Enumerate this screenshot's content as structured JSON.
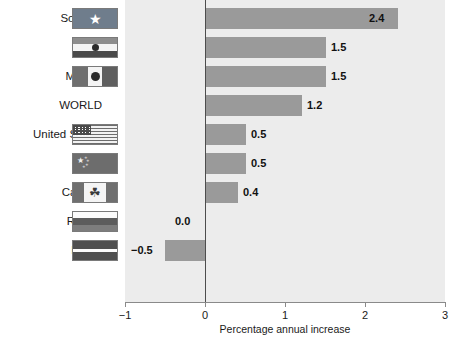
{
  "chart_data": {
    "type": "bar",
    "orientation": "horizontal",
    "title": "",
    "xlabel": "Percentage annual increase",
    "ylabel": "",
    "xlim": [
      -1,
      3
    ],
    "xticks": [
      "−1",
      "0",
      "1",
      "2",
      "3"
    ],
    "xtick_values": [
      -1,
      0,
      1,
      2,
      3
    ],
    "grid": false,
    "legend": "none",
    "categories": [
      "Somalia",
      "India",
      "Mexico",
      "WORLD",
      "United States",
      "China",
      "Canada",
      "Russia",
      "Latvia"
    ],
    "values": [
      2.4,
      1.5,
      1.5,
      1.2,
      0.5,
      0.5,
      0.4,
      0.0,
      -0.5
    ],
    "value_labels": [
      "2.4",
      "1.5",
      "1.5",
      "1.2",
      "0.5",
      "0.5",
      "0.4",
      "0.0",
      "−0.5"
    ],
    "bars": [
      {
        "label": "Somalia",
        "value": 2.4,
        "value_label": "2.4",
        "flag": "somalia-flag",
        "label_inside_bar": true
      },
      {
        "label": "India",
        "value": 1.5,
        "value_label": "1.5",
        "flag": "india-flag",
        "label_inside_bar": false
      },
      {
        "label": "Mexico",
        "value": 1.5,
        "value_label": "1.5",
        "flag": "mexico-flag",
        "label_inside_bar": false
      },
      {
        "label": "WORLD",
        "value": 1.2,
        "value_label": "1.2",
        "flag": "none",
        "label_inside_bar": false
      },
      {
        "label": "United States",
        "value": 0.5,
        "value_label": "0.5",
        "flag": "united-states-flag",
        "label_inside_bar": false
      },
      {
        "label": "China",
        "value": 0.5,
        "value_label": "0.5",
        "flag": "china-flag",
        "label_inside_bar": false
      },
      {
        "label": "Canada",
        "value": 0.4,
        "value_label": "0.4",
        "flag": "canada-flag",
        "label_inside_bar": false
      },
      {
        "label": "Russia",
        "value": 0.0,
        "value_label": "0.0",
        "flag": "russia-flag",
        "label_inside_bar": false
      },
      {
        "label": "Latvia",
        "value": -0.5,
        "value_label": "−0.5",
        "flag": "latvia-flag",
        "label_inside_bar": false
      }
    ]
  },
  "colors": {
    "bar": "#9a9a9a",
    "plot_background": "#ececec",
    "axis": "#4d4d4d",
    "text": "#1a1a1a",
    "page_background": "#ffffff"
  }
}
